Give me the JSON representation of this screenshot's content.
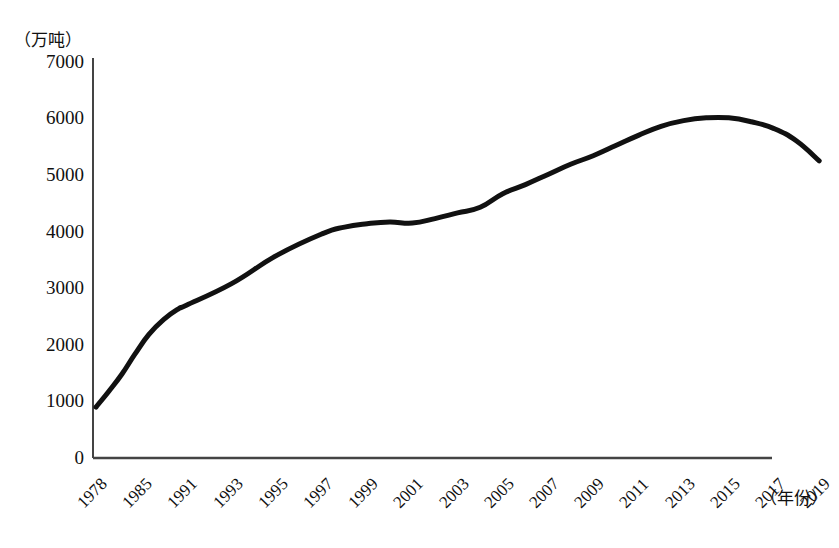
{
  "chart_data": {
    "type": "line",
    "title": "",
    "subtitle": "",
    "xlabel": "（年份）",
    "ylabel": "（万吨）",
    "ylim": [
      0,
      7000
    ],
    "yticks": [
      0,
      1000,
      2000,
      3000,
      4000,
      5000,
      6000,
      7000
    ],
    "ytick_labels": [
      "0",
      "1000",
      "2000",
      "3000",
      "4000",
      "5000",
      "6000",
      "7000"
    ],
    "grid": false,
    "legend": null,
    "legend_position": "none",
    "categories": [
      "1978",
      "1985",
      "1991",
      "1993",
      "1995",
      "1997",
      "1999",
      "2001",
      "2003",
      "2005",
      "2007",
      "2009",
      "2011",
      "2013",
      "2015",
      "2017",
      "2019"
    ],
    "x": [
      1978,
      1985,
      1991,
      1993,
      1995,
      1997,
      1999,
      2001,
      2003,
      2005,
      2007,
      2009,
      2011,
      2013,
      2015,
      2017,
      2019
    ],
    "series": [
      {
        "name": "产量",
        "values": [
          900,
          2000,
          2700,
          3100,
          3600,
          4000,
          4150,
          4200,
          4350,
          4650,
          5000,
          5350,
          5700,
          5950,
          6000,
          5850,
          5250
        ]
      }
    ],
    "line_color": "#111111",
    "line_width": 5,
    "curve_points": [
      [
        1978,
        900
      ],
      [
        1980,
        1180
      ],
      [
        1982,
        1480
      ],
      [
        1984,
        1830
      ],
      [
        1986,
        2180
      ],
      [
        1988,
        2450
      ],
      [
        1990,
        2640
      ],
      [
        1991,
        2700
      ],
      [
        1993,
        3080
      ],
      [
        1995,
        3580
      ],
      [
        1997,
        3960
      ],
      [
        1998,
        4080
      ],
      [
        1999,
        4140
      ],
      [
        2000,
        4170
      ],
      [
        2001,
        4150
      ],
      [
        2002,
        4230
      ],
      [
        2003,
        4330
      ],
      [
        2004,
        4430
      ],
      [
        2005,
        4670
      ],
      [
        2006,
        4830
      ],
      [
        2007,
        5010
      ],
      [
        2008,
        5190
      ],
      [
        2009,
        5340
      ],
      [
        2010,
        5520
      ],
      [
        2011,
        5700
      ],
      [
        2012,
        5860
      ],
      [
        2013,
        5960
      ],
      [
        2014,
        6010
      ],
      [
        2015,
        6010
      ],
      [
        2016,
        5940
      ],
      [
        2017,
        5820
      ],
      [
        2018,
        5600
      ],
      [
        2019,
        5250
      ]
    ],
    "axis_style": "left-and-bottom-spine-only",
    "axis_color": "#444444"
  },
  "caption": ""
}
